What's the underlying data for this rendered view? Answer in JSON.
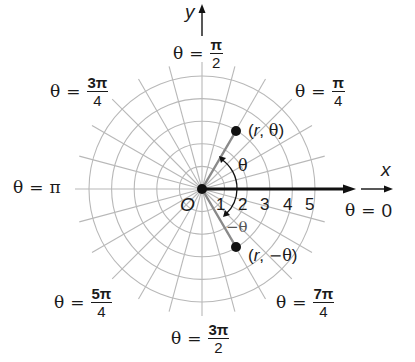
{
  "diagram": {
    "origin": {
      "x": 202,
      "y": 189,
      "label": "O"
    },
    "grid": {
      "ring_count": 5,
      "ring_spacing_px": 22.6,
      "ray_count": 24,
      "ray_step_degrees": 15,
      "ray_length_px": 127,
      "color": "#b8b8b8"
    },
    "axes": {
      "x_label": "x",
      "y_label": "y",
      "polar_axis_color": "#111111"
    },
    "ticks": [
      "1",
      "2",
      "3",
      "4",
      "5"
    ],
    "angle_labels": {
      "zero": {
        "theta": "θ",
        "eq": "=",
        "value": "0"
      },
      "pi_over_4": {
        "theta": "θ",
        "eq": "=",
        "num": "π",
        "den": "4"
      },
      "pi_over_2": {
        "theta": "θ",
        "eq": "=",
        "num": "π",
        "den": "2"
      },
      "three_pi_over_4": {
        "theta": "θ",
        "eq": "=",
        "num": "3π",
        "den": "4"
      },
      "pi": {
        "theta": "θ",
        "eq": "=",
        "value": "π"
      },
      "five_pi_over_4": {
        "theta": "θ",
        "eq": "=",
        "num": "5π",
        "den": "4"
      },
      "three_pi_over_2": {
        "theta": "θ",
        "eq": "=",
        "num": "3π",
        "den": "2"
      },
      "seven_pi_over_4": {
        "theta": "θ",
        "eq": "=",
        "num": "7π",
        "den": "4"
      }
    },
    "points": [
      {
        "label_open": "(",
        "label_r": "r",
        "label_sep": ", ",
        "label_theta": "θ",
        "label_close": ")",
        "r": 3,
        "angle_deg": 60
      },
      {
        "label_open": "(",
        "label_r": "r",
        "label_sep": ", ",
        "label_theta": "−θ",
        "label_close": ")",
        "r": 3,
        "angle_deg": -60
      }
    ],
    "arc_labels": {
      "positive": "θ",
      "negative": "−θ"
    },
    "colors": {
      "ray_to_point": "#8a8a8a",
      "text": "#1a1a1a",
      "grid": "#b8b8b8"
    }
  }
}
